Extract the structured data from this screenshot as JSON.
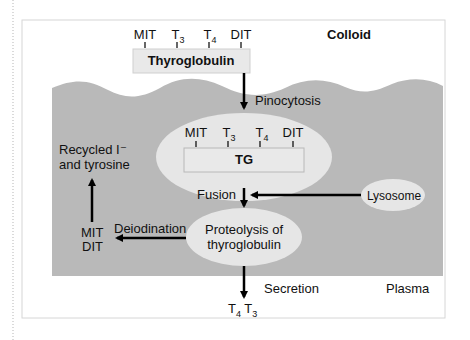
{
  "diagram": {
    "regions": {
      "colloid": "Colloid",
      "plasma": "Plasma"
    },
    "top": {
      "residues": [
        {
          "base": "MIT",
          "sub": ""
        },
        {
          "base": "T",
          "sub": "3"
        },
        {
          "base": "T",
          "sub": "4"
        },
        {
          "base": "DIT",
          "sub": ""
        }
      ],
      "box_label": "Thyroglobulin"
    },
    "vesicle": {
      "residues": [
        {
          "base": "MIT",
          "sub": ""
        },
        {
          "base": "T",
          "sub": "3"
        },
        {
          "base": "T",
          "sub": "4"
        },
        {
          "base": "DIT",
          "sub": ""
        }
      ],
      "box_label": "TG"
    },
    "steps": {
      "pinocytosis": "Pinocytosis",
      "fusion": "Fusion",
      "lysosome": "Lysosome",
      "proteolysis_line1": "Proteolysis of",
      "proteolysis_line2": "thyroglobulin",
      "deiodination": "Deiodination",
      "mit": "MIT",
      "dit": "DIT",
      "recycled_line1": "Recycled I⁻",
      "recycled_line2": "and tyrosine",
      "secretion": "Secretion"
    },
    "output": [
      {
        "base": "T",
        "sub": "4"
      },
      {
        "base": "T",
        "sub": "3"
      }
    ],
    "colors": {
      "cell_fill": "#b9b9b9",
      "ellipse_fill": "#e6e6e6",
      "box_fill": "#e9e9e9",
      "arrow": "#000000",
      "frame": "#d6d6d6"
    }
  }
}
